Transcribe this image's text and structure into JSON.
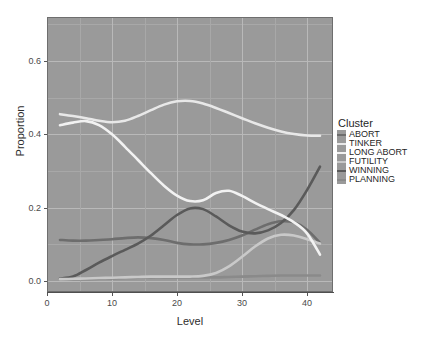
{
  "chart_data": {
    "type": "line",
    "title": "",
    "xlabel": "Level",
    "ylabel": "Proportion",
    "xlim": [
      0,
      44
    ],
    "ylim": [
      -0.03,
      0.72
    ],
    "xticks": [
      "0",
      "10",
      "20",
      "30",
      "40"
    ],
    "xtick_values": [
      0,
      10,
      20,
      30,
      40
    ],
    "yticks": [
      "0.0",
      "0.2",
      "0.4",
      "0.6"
    ],
    "ytick_values": [
      0.0,
      0.2,
      0.4,
      0.6
    ],
    "grid": true,
    "legend_position": "right",
    "legend_title": "Cluster",
    "x": [
      2,
      4,
      6,
      8,
      10,
      12,
      14,
      16,
      18,
      20,
      22,
      24,
      26,
      28,
      30,
      32,
      34,
      36,
      38,
      40,
      42
    ],
    "series": [
      {
        "name": "ABORT",
        "color": "#6d6d6d",
        "values": [
          0.112,
          0.11,
          0.11,
          0.112,
          0.114,
          0.117,
          0.119,
          0.117,
          0.112,
          0.104,
          0.1,
          0.1,
          0.104,
          0.112,
          0.124,
          0.14,
          0.155,
          0.163,
          0.16,
          0.14,
          0.104
        ]
      },
      {
        "name": "TINKER",
        "color": "#e8e8e8",
        "values": [
          0.455,
          0.45,
          0.444,
          0.437,
          0.433,
          0.437,
          0.45,
          0.466,
          0.481,
          0.49,
          0.491,
          0.484,
          0.472,
          0.458,
          0.444,
          0.43,
          0.418,
          0.408,
          0.401,
          0.397,
          0.396
        ]
      },
      {
        "name": "LONG ABORT",
        "color": "#f2f2f2",
        "values": [
          0.425,
          0.432,
          0.436,
          0.425,
          0.4,
          0.366,
          0.33,
          0.294,
          0.26,
          0.233,
          0.218,
          0.22,
          0.24,
          0.246,
          0.232,
          0.213,
          0.196,
          0.18,
          0.16,
          0.13,
          0.072
        ]
      },
      {
        "name": "FUTILITY",
        "color": "#c9c9c9",
        "values": [
          0.005,
          0.006,
          0.007,
          0.008,
          0.009,
          0.01,
          0.011,
          0.012,
          0.012,
          0.012,
          0.012,
          0.014,
          0.022,
          0.04,
          0.066,
          0.094,
          0.116,
          0.126,
          0.124,
          0.114,
          0.102
        ]
      },
      {
        "name": "WINNING",
        "color": "#5a5a5a",
        "values": [
          0.007,
          0.012,
          0.03,
          0.05,
          0.068,
          0.085,
          0.102,
          0.124,
          0.152,
          0.18,
          0.198,
          0.196,
          0.176,
          0.152,
          0.135,
          0.13,
          0.138,
          0.158,
          0.194,
          0.248,
          0.312
        ]
      },
      {
        "name": "PLANNING",
        "color": "#8a8a8a",
        "values": [
          0.005,
          0.005,
          0.005,
          0.006,
          0.007,
          0.008,
          0.009,
          0.01,
          0.01,
          0.01,
          0.01,
          0.01,
          0.01,
          0.011,
          0.012,
          0.013,
          0.014,
          0.015,
          0.015,
          0.015,
          0.015
        ]
      }
    ]
  },
  "axes": {
    "y_title": "Proportion",
    "x_title": "Level",
    "y_tick_labels": [
      "0.6",
      "0.4",
      "0.2",
      "0.0"
    ],
    "x_tick_labels": [
      "0",
      "10",
      "20",
      "30",
      "40"
    ]
  },
  "legend": {
    "title": "Cluster",
    "items": [
      {
        "label": "ABORT",
        "color": "#6d6d6d"
      },
      {
        "label": "TINKER",
        "color": "#e8e8e8"
      },
      {
        "label": "LONG ABORT",
        "color": "#f2f2f2"
      },
      {
        "label": "FUTILITY",
        "color": "#c9c9c9"
      },
      {
        "label": "WINNING",
        "color": "#5a5a5a"
      },
      {
        "label": "PLANNING",
        "color": "#8a8a8a"
      }
    ]
  },
  "panel": {
    "background": "#9a9a9a",
    "grid_color": "#b9b9b9"
  },
  "title_sliver": ""
}
